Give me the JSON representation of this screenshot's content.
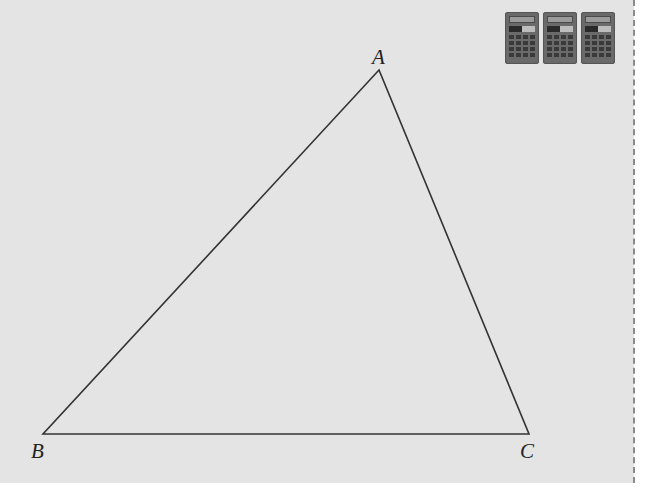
{
  "figure": {
    "type": "triangle",
    "vertices": [
      {
        "label": "A",
        "x": 379,
        "y": 70
      },
      {
        "label": "B",
        "x": 43,
        "y": 434
      },
      {
        "label": "C",
        "x": 529,
        "y": 434
      }
    ],
    "labels": {
      "A": "A",
      "B": "B",
      "C": "C"
    },
    "stroke_color": "#333333",
    "background_color": "#e4e4e4"
  },
  "toolbar": {
    "calculator_count": 3,
    "icons": [
      "calculator-icon",
      "calculator-icon",
      "calculator-icon"
    ]
  }
}
